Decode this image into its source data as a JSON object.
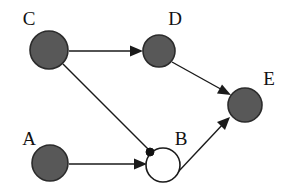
{
  "diagram": {
    "canvas": {
      "width": 286,
      "height": 188,
      "background": "#ffffff"
    },
    "colors": {
      "filled_node_fill": "#585858",
      "filled_node_stroke": "#2b2b2b",
      "open_node_fill": "#ffffff",
      "open_node_stroke": "#1a1a1a",
      "edge": "#1a1a1a",
      "label": "#111111",
      "join_dot": "#111111"
    },
    "nodes": [
      {
        "id": "C",
        "label": "C",
        "style": "filled",
        "cx": 49,
        "cy": 50,
        "r": 19,
        "label_x": 29,
        "label_y": 25
      },
      {
        "id": "D",
        "label": "D",
        "style": "filled",
        "cx": 159,
        "cy": 51,
        "r": 16,
        "label_x": 175,
        "label_y": 25
      },
      {
        "id": "E",
        "label": "E",
        "style": "filled",
        "cx": 245,
        "cy": 105,
        "r": 17,
        "label_x": 269,
        "label_y": 85
      },
      {
        "id": "A",
        "label": "A",
        "style": "filled",
        "cx": 50,
        "cy": 163,
        "r": 18,
        "label_x": 29,
        "label_y": 145
      },
      {
        "id": "B",
        "label": "B",
        "style": "open",
        "cx": 163,
        "cy": 165,
        "r": 17,
        "label_x": 181,
        "label_y": 145
      }
    ],
    "join_dot": {
      "cx": 150,
      "cy": 152,
      "r": 4
    },
    "edges": [
      {
        "id": "C-D",
        "from": "C",
        "to": "D",
        "arrowhead": true,
        "x1": 69,
        "y1": 51,
        "x2": 143,
        "y2": 51
      },
      {
        "id": "C-B",
        "from": "C",
        "to": "B",
        "arrowhead": false,
        "x1": 63,
        "y1": 64,
        "x2": 150,
        "y2": 151
      },
      {
        "id": "A-B",
        "from": "A",
        "to": "B",
        "arrowhead": true,
        "x1": 69,
        "y1": 164,
        "x2": 147,
        "y2": 164
      },
      {
        "id": "D-E",
        "from": "D",
        "to": "E",
        "arrowhead": true,
        "x1": 172,
        "y1": 62,
        "x2": 230,
        "y2": 94
      },
      {
        "id": "B-E",
        "from": "B",
        "to": "E",
        "arrowhead": true,
        "x1": 178,
        "y1": 172,
        "x2": 229,
        "y2": 118
      }
    ]
  }
}
